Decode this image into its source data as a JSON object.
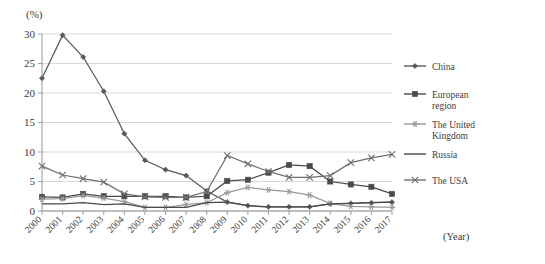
{
  "chart_data": {
    "type": "line",
    "title": "",
    "xlabel": "(Year)",
    "ylabel": "(%)",
    "ylim": [
      0,
      30
    ],
    "yticks": [
      0,
      5,
      10,
      15,
      20,
      25,
      30
    ],
    "grid": true,
    "legend_position": "right",
    "categories": [
      "2000",
      "2001",
      "2002",
      "2003",
      "2004",
      "2005",
      "2006",
      "2007",
      "2008",
      "2009",
      "2010",
      "2011",
      "2012",
      "2013",
      "2014",
      "2015",
      "2016",
      "2017"
    ],
    "series": [
      {
        "name": "China",
        "marker": "diamond",
        "color": "#595959",
        "values": [
          22.5,
          29.8,
          26.1,
          20.3,
          13.1,
          8.6,
          7.0,
          6.0,
          3.4,
          1.5,
          0.9,
          0.7,
          0.7,
          0.7,
          1.2,
          1.3,
          1.4,
          1.5
        ]
      },
      {
        "name": "European region",
        "marker": "square",
        "color": "#4a4a4a",
        "values": [
          2.4,
          2.3,
          2.9,
          2.5,
          2.5,
          2.5,
          2.5,
          2.3,
          2.5,
          5.1,
          5.3,
          6.5,
          7.8,
          7.6,
          5.0,
          4.5,
          4.1,
          2.9
        ]
      },
      {
        "name": "The United Kingdom",
        "marker": "asterisk",
        "color": "#9a9a9a",
        "values": [
          2.0,
          2.1,
          2.6,
          2.2,
          1.6,
          0.6,
          0.6,
          1.1,
          1.4,
          3.1,
          4.0,
          3.6,
          3.3,
          2.7,
          1.3,
          0.8,
          0.7,
          0.6
        ]
      },
      {
        "name": "Russia",
        "marker": "none",
        "color": "#4a4a4a",
        "values": [
          1.2,
          1.2,
          1.4,
          1.1,
          1.2,
          0.6,
          0.6,
          0.6,
          1.4,
          1.5,
          0.9,
          0.7,
          0.7,
          0.7,
          1.2,
          1.3,
          1.4,
          1.5
        ]
      },
      {
        "name": "The USA",
        "marker": "cross",
        "color": "#6e6e6e",
        "values": [
          7.6,
          6.1,
          5.5,
          4.9,
          2.9,
          2.4,
          2.3,
          2.3,
          3.3,
          9.4,
          8.0,
          6.7,
          5.7,
          5.7,
          6.0,
          8.2,
          9.0,
          9.6
        ]
      }
    ]
  }
}
